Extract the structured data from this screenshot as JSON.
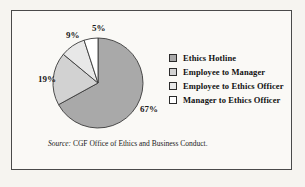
{
  "figure": {
    "source_keyword": "Source:",
    "source_text": "CGF Office of Ethics and Business Conduct."
  },
  "legend": {
    "items": [
      {
        "label": "Ethics Hotline",
        "color": "#a9a9a9",
        "swatch_name": "legend-swatch-ethics-hotline"
      },
      {
        "label": "Employee to Manager",
        "color": "#d2d2d2",
        "swatch_name": "legend-swatch-employee-to-manager"
      },
      {
        "label": "Employee to Ethics Officer",
        "color": "#e8e8e8",
        "swatch_name": "legend-swatch-employee-to-ethics-officer"
      },
      {
        "label": "Manager to Ethics Officer",
        "color": "#ffffff",
        "swatch_name": "legend-swatch-manager-to-ethics-officer"
      }
    ]
  },
  "chart_data": {
    "type": "pie",
    "title": "",
    "categories": [
      "Ethics Hotline",
      "Employee to Manager",
      "Employee to Ethics Officer",
      "Manager to Ethics Officer"
    ],
    "values": [
      67,
      19,
      9,
      5
    ],
    "value_labels": [
      "67%",
      "19%",
      "9%",
      "5%"
    ],
    "units": "percent",
    "colors": [
      "#a9a9a9",
      "#d2d2d2",
      "#e8e8e8",
      "#ffffff"
    ],
    "slice_outline_color": "#3a3a3a",
    "legend_position": "right",
    "grid": false,
    "start_angle_deg": 0,
    "direction": "clockwise",
    "label_positions": [
      {
        "label": "67%",
        "left": 128,
        "top": 94
      },
      {
        "label": "19%",
        "left": 26,
        "top": 64
      },
      {
        "label": "9%",
        "left": 54,
        "top": 20
      },
      {
        "label": "5%",
        "left": 80,
        "top": 13
      }
    ],
    "center": {
      "cx": 86,
      "cy": 72
    },
    "radius": 45
  }
}
